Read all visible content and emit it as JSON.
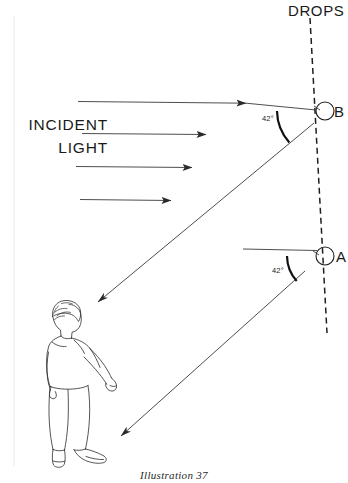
{
  "figure": {
    "caption": "Illustration  37",
    "background_color": "#ffffff",
    "ink_color": "#2a2a2a",
    "width": 348,
    "height": 483
  },
  "labels": {
    "drops": "DROPS",
    "incident_line1": "INCIDENT",
    "incident_line2": "LIGHT",
    "point_b": "B",
    "point_a": "A",
    "angle_b": "42°",
    "angle_a": "42°"
  },
  "geometry": {
    "dashed_line": {
      "name": "drops-axis",
      "x1": 310,
      "y1": 18,
      "x2": 327,
      "y2": 333
    },
    "drop_b": {
      "cx": 325,
      "cy": 111,
      "r": 9
    },
    "drop_a": {
      "cx": 325,
      "cy": 256,
      "r": 9
    },
    "incident_rays": [
      {
        "x1": 78,
        "y": 102,
        "x2": 316,
        "arrow_x": 248
      },
      {
        "x1": 82,
        "y": 134,
        "x2": 210,
        "arrow_x": 208
      },
      {
        "x1": 76,
        "y": 167,
        "x2": 196,
        "arrow_x": 194
      },
      {
        "x1": 80,
        "y": 200,
        "x2": 175,
        "arrow_x": 173
      }
    ],
    "reflected_ray_b": {
      "x1": 312,
      "y1": 122,
      "x2": 95,
      "y2": 304
    },
    "reflected_ray_a": {
      "x1": 303,
      "y1": 272,
      "x2": 118,
      "y2": 438
    },
    "angle_arc_b": {
      "cx": 325,
      "cy": 111,
      "r": 48,
      "from_deg": 180,
      "to_deg": 222
    },
    "angle_arc_a": {
      "cx": 325,
      "cy": 256,
      "r": 38,
      "from_deg": 180,
      "to_deg": 222
    }
  },
  "observer": {
    "name": "person-observer",
    "description": "standing man looking up-right"
  }
}
